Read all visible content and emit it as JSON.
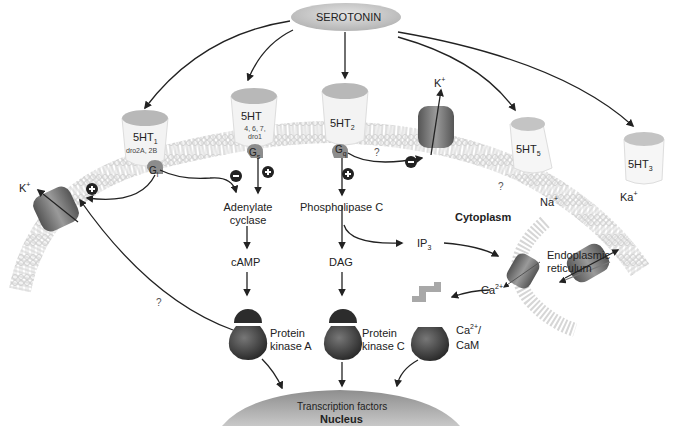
{
  "ligand": {
    "label": "SEROTONIN"
  },
  "receptors": [
    {
      "id": "5ht1",
      "name": "5HT",
      "subscript": "1",
      "subtypes": "dro2A, 2B",
      "g_protein": "G",
      "g_sub": "i"
    },
    {
      "id": "5ht4",
      "name": "5HT",
      "subscript": "",
      "subtypes_line1": "4, 6, 7,",
      "subtypes_line2": "dro1",
      "g_protein": "G",
      "g_sub": "s"
    },
    {
      "id": "5ht2",
      "name": "5HT",
      "subscript": "2",
      "g_protein": "G",
      "g_sub": "q"
    },
    {
      "id": "5ht5",
      "name": "5HT",
      "subscript": "5"
    },
    {
      "id": "5ht3",
      "name": "5HT",
      "subscript": "3"
    }
  ],
  "ions": {
    "k_left": "K",
    "k_left_sup": "+",
    "k_mid": "K",
    "k_mid_sup": "+",
    "na": "Na",
    "na_sup": "+",
    "ka": "Ka",
    "ka_sup": "+",
    "ca": "Ca",
    "ca_sup": "2+"
  },
  "effectors": {
    "adenylate_cyclase_1": "Adenylate",
    "adenylate_cyclase_2": "cyclase",
    "phospholipase": "Phospholipase C",
    "camp": "cAMP",
    "dag": "DAG",
    "ip3": "IP",
    "ip3_sub": "3"
  },
  "kinases": {
    "pka_1": "Protein",
    "pka_2": "kinase A",
    "pkc_1": "Protein",
    "pkc_2": "kinase C",
    "cam_1": "Ca",
    "cam_sup": "2+",
    "cam_slash": "/",
    "cam_2": "CaM"
  },
  "compartments": {
    "cytoplasm": "Cytoplasm",
    "er_1": "Endoplasmic",
    "er_2": "reticulum",
    "transcription": "Transcription factors",
    "nucleus": "Nucleus"
  },
  "symbols": {
    "unknown": "?",
    "plus": "+",
    "minus": "−"
  },
  "colors": {
    "membrane": "#d8d8d8",
    "channel": "#7a7a7a",
    "kinase": "#3a3a3a",
    "receptor_top": "#b8b8b8",
    "g_protein": "#8c8c8c",
    "nucleus": "#a0a0a0"
  }
}
